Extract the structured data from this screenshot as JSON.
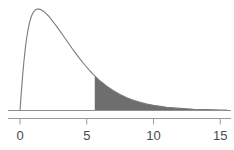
{
  "chart_data": {
    "type": "area",
    "title": "",
    "subtitle": "",
    "xlabel": "",
    "ylabel": "",
    "xlim": [
      -1.5,
      16.0
    ],
    "ylim": [
      0,
      1.0
    ],
    "grid": false,
    "legend": null,
    "annotations": [],
    "axis": {
      "tick_values": [
        0,
        5,
        10,
        15
      ],
      "tick_labels": [
        "0",
        "5",
        "10",
        "15"
      ],
      "tick_direction": "down",
      "axis_line_color": "#9a9a9a",
      "baseline_color": "#8f8f8f"
    },
    "series": [
      {
        "name": "density",
        "kind": "line",
        "line_color": "#7a7a7a",
        "description": "right-skewed probability density curve, peak near x=1.4",
        "x": [
          0.0,
          0.1,
          0.2,
          0.3,
          0.4,
          0.5,
          0.6,
          0.7,
          0.8,
          0.9,
          1.0,
          1.1,
          1.2,
          1.3,
          1.4,
          1.5,
          1.6,
          1.7,
          1.8,
          1.9,
          2.0,
          2.2,
          2.4,
          2.6,
          2.8,
          3.0,
          3.25,
          3.5,
          3.75,
          4.0,
          4.25,
          4.5,
          4.75,
          5.0,
          5.25,
          5.5,
          5.6,
          5.75,
          6.0,
          6.5,
          7.0,
          7.5,
          8.0,
          8.5,
          9.0,
          9.5,
          10.0,
          10.5,
          11.0,
          11.5,
          12.0,
          12.5,
          13.0,
          13.5,
          14.0,
          14.5,
          15.0,
          15.5,
          16.0
        ],
        "y": [
          0.0,
          0.176,
          0.337,
          0.478,
          0.597,
          0.694,
          0.773,
          0.834,
          0.881,
          0.916,
          0.94,
          0.956,
          0.966,
          0.97,
          0.971,
          0.968,
          0.963,
          0.955,
          0.946,
          0.935,
          0.923,
          0.895,
          0.863,
          0.83,
          0.795,
          0.759,
          0.713,
          0.667,
          0.622,
          0.577,
          0.534,
          0.492,
          0.452,
          0.414,
          0.378,
          0.344,
          0.331,
          0.313,
          0.283,
          0.232,
          0.189,
          0.153,
          0.123,
          0.099,
          0.079,
          0.063,
          0.05,
          0.04,
          0.031,
          0.025,
          0.02,
          0.016,
          0.012,
          0.01,
          0.008,
          0.006,
          0.005,
          0.004,
          0.003
        ]
      }
    ],
    "shaded_region": {
      "label": "right tail",
      "from_x": 5.6,
      "to_x": 16.0,
      "fill_color": "#6e6e6e",
      "edge_color": "#555555",
      "has_vertical_boundary": true
    }
  }
}
